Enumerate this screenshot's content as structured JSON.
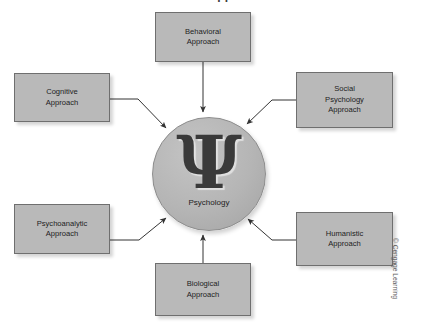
{
  "figure": {
    "title": "The Seven Approaches",
    "credit": "© Cengage Learning"
  },
  "hub": {
    "symbol": "Ψ",
    "symbol_name": "greek-capital-psi",
    "label": "Psychology"
  },
  "nodes": [
    {
      "id": "behavioral",
      "line1": "Behavioral",
      "line2": "Approach",
      "line3": ""
    },
    {
      "id": "cognitive",
      "line1": "Cognitive",
      "line2": "Approach",
      "line3": ""
    },
    {
      "id": "social",
      "line1": "Social",
      "line2": "Psychology",
      "line3": "Approach"
    },
    {
      "id": "psychoanalytic",
      "line1": "Psychoanalytic",
      "line2": "Approach",
      "line3": ""
    },
    {
      "id": "humanistic",
      "line1": "Humanistic",
      "line2": "Approach",
      "line3": ""
    },
    {
      "id": "biological",
      "line1": "Biological",
      "line2": "Approach",
      "line3": ""
    }
  ],
  "colors": {
    "box_fill": "#b9b9b9",
    "box_border": "#6f6f6f",
    "circle_fill": "#b5b5b5",
    "arrow": "#333333",
    "text": "#1d1d1d",
    "background": "#ffffff"
  }
}
